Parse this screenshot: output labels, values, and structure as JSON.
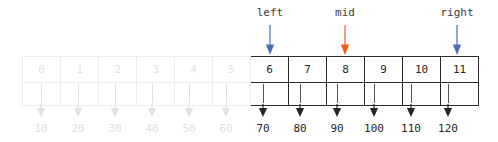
{
  "diagram": {
    "colors": {
      "pointer_blue": "#4a6fb5",
      "pointer_orange": "#ef5a1f",
      "active_border": "#2b2b2b",
      "active_text": "#262626",
      "faded_border": "#ededed",
      "faded_text": "#e2e2e2",
      "stem_active": "#555555",
      "stem_faded": "#e0e0e0",
      "label_text": "#3c3c3c",
      "background": "#ffffff"
    },
    "pointers": [
      {
        "label": "left",
        "color": "#4a6fb5",
        "index": 6,
        "x": 270,
        "label_x": 270,
        "label_y": 6
      },
      {
        "label": "mid",
        "color": "#ef5a1f",
        "index": 8,
        "x": 345,
        "label_x": 345,
        "label_y": 6
      },
      {
        "label": "right",
        "color": "#4a6fb5",
        "index": 11,
        "x": 457,
        "label_x": 457,
        "label_y": 6
      }
    ],
    "cells": [
      {
        "index": "0",
        "value": "10",
        "state": "faded",
        "x": 41
      },
      {
        "index": "1",
        "value": "20",
        "state": "faded",
        "x": 78
      },
      {
        "index": "2",
        "value": "30",
        "state": "faded",
        "x": 115
      },
      {
        "index": "3",
        "value": "40",
        "state": "faded",
        "x": 152
      },
      {
        "index": "4",
        "value": "50",
        "state": "faded",
        "x": 189
      },
      {
        "index": "5",
        "value": "60",
        "state": "faded",
        "x": 226
      },
      {
        "index": "6",
        "value": "70",
        "state": "active",
        "x": 263
      },
      {
        "index": "7",
        "value": "80",
        "state": "active",
        "x": 300
      },
      {
        "index": "8",
        "value": "90",
        "state": "active",
        "x": 337
      },
      {
        "index": "9",
        "value": "100",
        "state": "active",
        "x": 374
      },
      {
        "index": "10",
        "value": "110",
        "state": "active",
        "x": 411
      },
      {
        "index": "11",
        "value": "120",
        "state": "active",
        "x": 448
      }
    ]
  }
}
